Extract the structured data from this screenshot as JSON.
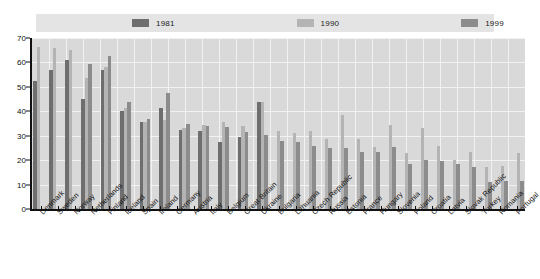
{
  "legend": {
    "items": [
      {
        "label": "1981",
        "color": "#6e6e6e"
      },
      {
        "label": "1990",
        "color": "#b4b4b4"
      },
      {
        "label": "1999",
        "color": "#8c8c8c"
      }
    ]
  },
  "axis": {
    "y_ticks": [
      "0",
      "10",
      "20",
      "30",
      "40",
      "50",
      "60",
      "70"
    ]
  },
  "chart_data": {
    "type": "bar",
    "title": "",
    "subtitle": "",
    "xlabel": "",
    "ylabel": "",
    "ylim": [
      0,
      70
    ],
    "ytick_step": 10,
    "grid": true,
    "legend_position": "top",
    "categories": [
      "Denmark",
      "Sweden",
      "Norway",
      "Netherlands",
      "Finland",
      "Iceland",
      "Spain",
      "Ireland",
      "Germany",
      "Austria",
      "Italy",
      "Belgium",
      "Great Britain",
      "Ukraine",
      "Bulgaria",
      "Lithuania",
      "Czech Republic",
      "Russia",
      "Estonia",
      "France",
      "Hungary",
      "Slovenia",
      "Poland",
      "Croatia",
      "Latvia",
      "Slovak Republic",
      "Turkey",
      "Romania",
      "Portugal"
    ],
    "series": [
      {
        "name": "1981",
        "color": "#6e6e6e",
        "values": [
          52.5,
          57.0,
          61.0,
          45.0,
          57.0,
          40.0,
          35.5,
          41.5,
          32.5,
          32.0,
          27.5,
          29.5,
          44.0,
          null,
          null,
          null,
          null,
          null,
          null,
          null,
          null,
          null,
          null,
          null,
          null,
          null,
          null,
          null,
          null
        ]
      },
      {
        "name": "1990",
        "color": "#b4b4b4",
        "values": [
          66.5,
          66.0,
          65.0,
          53.5,
          58.0,
          41.5,
          35.5,
          36.5,
          33.0,
          34.5,
          35.5,
          34.0,
          44.0,
          32.0,
          31.0,
          32.0,
          28.5,
          38.5,
          28.5,
          25.5,
          34.5,
          23.0,
          33.0,
          26.0,
          20.0,
          23.5,
          17.0,
          17.5,
          23.0
        ]
      },
      {
        "name": "1999",
        "color": "#8c8c8c",
        "values": [
          null,
          null,
          null,
          59.5,
          62.5,
          44.0,
          37.0,
          47.5,
          35.0,
          34.0,
          33.5,
          31.5,
          30.5,
          28.0,
          27.5,
          26.0,
          25.0,
          25.0,
          23.5,
          23.5,
          25.5,
          18.5,
          20.0,
          19.5,
          18.5,
          17.0,
          11.0,
          11.5,
          11.5
        ]
      }
    ]
  }
}
